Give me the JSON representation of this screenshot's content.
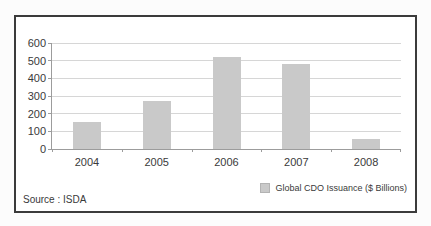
{
  "window": {
    "background": "#fcfcfc"
  },
  "frame": {
    "border_color": "#3b3b3b",
    "background": "#ffffff"
  },
  "source_label": "Source : ISDA",
  "legend": {
    "label": "Global CDO Issuance ($ Billions)"
  },
  "chart_data": {
    "type": "bar",
    "title": "",
    "categories": [
      "2004",
      "2005",
      "2006",
      "2007",
      "2008"
    ],
    "values": [
      155,
      270,
      520,
      480,
      55
    ],
    "series_name": "Global CDO Issuance ($ Billions)",
    "xlabel": "",
    "ylabel": "",
    "ylim": [
      0,
      600
    ],
    "yticks": [
      0,
      100,
      200,
      300,
      400,
      500,
      600
    ],
    "grid": true,
    "legend_position": "bottom-right",
    "colors": {
      "bar": "#c9c9c9",
      "gridline": "#d6d6d6",
      "axis": "#9c9c9c",
      "text": "#3a3a3a"
    }
  }
}
